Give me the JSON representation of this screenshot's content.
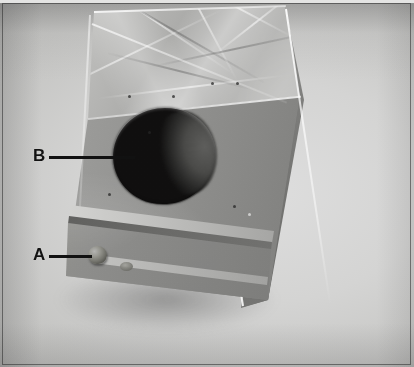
{
  "figure": {
    "kind": "photograph",
    "orientation": "three-quarter view, sloped top facing upper-left"
  },
  "callouts": [
    {
      "id": "callout-b",
      "label": "B",
      "leader": "horizontal-line",
      "points_to": "circular port opening on the front face"
    },
    {
      "id": "callout-a",
      "label": "A",
      "leader": "horizontal-line",
      "points_to": "round knob on the lower left of the front panel"
    }
  ],
  "colors": {
    "label_text": "#121212",
    "leader_line": "#111111",
    "backdrop": "#d4d4d3",
    "plate_frame": "#282828",
    "port_dark": "#100f0f",
    "metal_light": "#d8d8d6",
    "metal_mid": "#8d8d8b",
    "metal_dark": "#6a6a68"
  }
}
